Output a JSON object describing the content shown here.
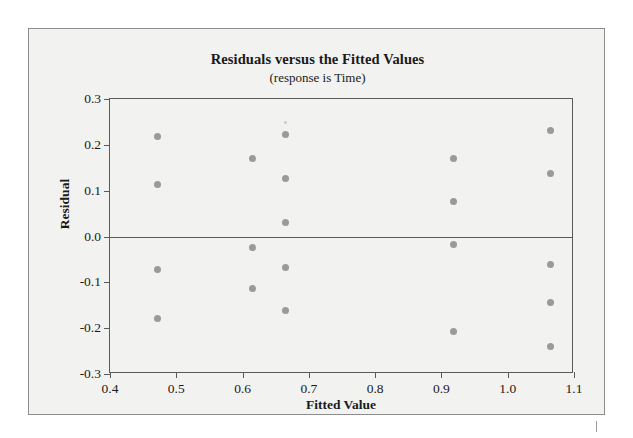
{
  "chart_data": {
    "type": "scatter",
    "title": "Residuals versus the Fitted Values",
    "subtitle": "(response is Time)",
    "xlabel": "Fitted Value",
    "ylabel": "Residual",
    "xlim": [
      0.4,
      1.1
    ],
    "ylim": [
      -0.3,
      0.3
    ],
    "xticks": [
      0.4,
      0.5,
      0.6,
      0.7,
      0.8,
      0.9,
      1.0,
      1.1
    ],
    "xtick_labels": [
      "0.4",
      "0.5",
      "0.6",
      "0.7",
      "0.8",
      "0.9",
      "1.0",
      "1.1"
    ],
    "yticks": [
      0.3,
      0.2,
      0.1,
      0.0,
      -0.1,
      -0.2,
      -0.3
    ],
    "ytick_labels": [
      "0.3",
      "0.2",
      "0.1",
      "0.0",
      "-0.1",
      "-0.2",
      "-0.3"
    ],
    "grid": false,
    "legend": false,
    "reference_line": {
      "axis": "y",
      "value": 0.0
    },
    "marker_color": "#9a9a9a",
    "points": [
      {
        "x": 0.472,
        "y": 0.218
      },
      {
        "x": 0.472,
        "y": 0.113
      },
      {
        "x": 0.472,
        "y": -0.073
      },
      {
        "x": 0.472,
        "y": -0.178
      },
      {
        "x": 0.615,
        "y": 0.171
      },
      {
        "x": 0.615,
        "y": -0.024
      },
      {
        "x": 0.615,
        "y": -0.113
      },
      {
        "x": 0.665,
        "y": 0.249,
        "faint": true
      },
      {
        "x": 0.665,
        "y": 0.222
      },
      {
        "x": 0.665,
        "y": 0.127
      },
      {
        "x": 0.665,
        "y": 0.031
      },
      {
        "x": 0.665,
        "y": -0.067
      },
      {
        "x": 0.665,
        "y": -0.162
      },
      {
        "x": 0.918,
        "y": 0.171
      },
      {
        "x": 0.918,
        "y": 0.076
      },
      {
        "x": 0.918,
        "y": -0.018
      },
      {
        "x": 0.918,
        "y": -0.207
      },
      {
        "x": 1.065,
        "y": 0.231
      },
      {
        "x": 1.065,
        "y": 0.138
      },
      {
        "x": 1.065,
        "y": -0.062
      },
      {
        "x": 1.065,
        "y": -0.144
      },
      {
        "x": 1.065,
        "y": -0.24
      }
    ]
  }
}
